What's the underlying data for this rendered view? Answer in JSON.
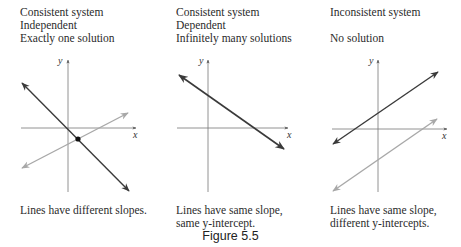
{
  "figure": {
    "caption": "Figure 5.5"
  },
  "panels": [
    {
      "heading": [
        "Consistent system",
        "Independent",
        "Exactly one solution"
      ],
      "caption": [
        "Lines have different slopes."
      ],
      "axes": {
        "x_label": "x",
        "y_label": "y"
      },
      "lines": [
        {
          "name": "line-1",
          "color": "#3a3a3a",
          "slope": "negative",
          "description": "dark line, steep negative slope"
        },
        {
          "name": "line-2",
          "color": "#a8a8a8",
          "slope": "positive",
          "description": "light line, shallow positive slope"
        }
      ],
      "intersection_point": true
    },
    {
      "heading": [
        "Consistent system",
        "Dependent",
        "Infinitely many solutions"
      ],
      "caption": [
        "Lines have same slope,",
        "same y-intercept."
      ],
      "axes": {
        "x_label": "x",
        "y_label": "y"
      },
      "lines": [
        {
          "name": "coincident-lines",
          "color": "#3a3a3a",
          "slope": "negative",
          "description": "two coincident lines"
        }
      ],
      "intersection_point": false
    },
    {
      "heading": [
        "Inconsistent system",
        "",
        "No solution"
      ],
      "caption": [
        "Lines have same slope,",
        "different y-intercepts."
      ],
      "axes": {
        "x_label": "x",
        "y_label": "y"
      },
      "lines": [
        {
          "name": "line-1",
          "color": "#3a3a3a",
          "slope": "positive",
          "description": "dark line, positive slope, higher intercept"
        },
        {
          "name": "line-2",
          "color": "#a8a8a8",
          "slope": "positive",
          "description": "light line, positive slope, lower intercept"
        }
      ],
      "intersection_point": false
    }
  ]
}
